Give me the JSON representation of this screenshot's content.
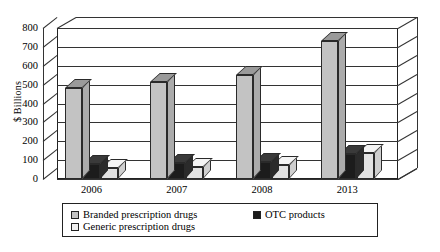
{
  "chart_data": {
    "type": "bar",
    "title": "",
    "xlabel": "",
    "ylabel": "$ Billions",
    "ylim": [
      0,
      800
    ],
    "yticks": [
      0,
      100,
      200,
      300,
      400,
      500,
      600,
      700,
      800
    ],
    "ytick_labels": [
      "0",
      "100",
      "200",
      "300",
      "400",
      "500",
      "600",
      "700",
      "800"
    ],
    "categories": [
      "2006",
      "2007",
      "2008",
      "2013"
    ],
    "grid": true,
    "legend_position": "bottom",
    "style": "3d-bar",
    "series": [
      {
        "name": "Branded prescription drugs",
        "color": "#c3c3c3",
        "values": [
          480,
          515,
          550,
          730
        ]
      },
      {
        "name": "OTC products",
        "color": "#1c1c1c",
        "values": [
          80,
          85,
          90,
          130
        ]
      },
      {
        "name": "Generic prescription drugs",
        "color": "#e2e2e2",
        "values": [
          60,
          65,
          75,
          140
        ]
      }
    ]
  },
  "legend": {
    "entries": [
      {
        "label": "Branded prescription drugs",
        "swatch": "branded-swatch"
      },
      {
        "label": "OTC products",
        "swatch": "otc-swatch"
      },
      {
        "label": "Generic prescription drugs",
        "swatch": "generic-swatch"
      }
    ]
  }
}
